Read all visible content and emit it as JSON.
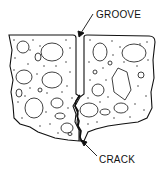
{
  "diagram": {
    "labels": {
      "groove": "GROOVE",
      "crack": "CRACK"
    },
    "colors": {
      "line": "#111111",
      "fill": "#ffffff"
    }
  }
}
